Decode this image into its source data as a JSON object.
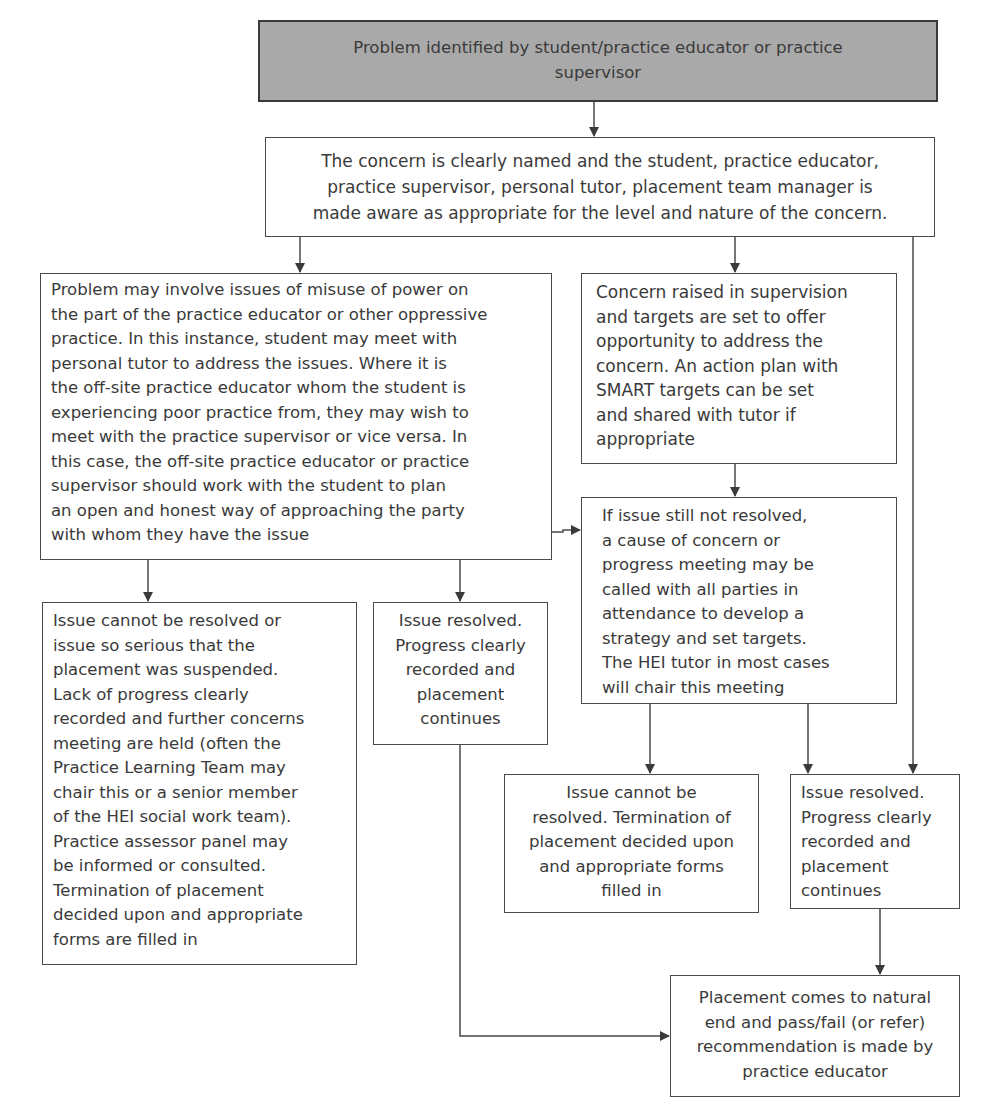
{
  "diagram": {
    "type": "flowchart",
    "nodes": {
      "start": {
        "text": "Problem identified by student/practice educator or practice supervisor",
        "lines": [
          "Problem identified by student/practice educator or practice",
          "supervisor"
        ],
        "fill": "#a9a9a9"
      },
      "concern_named": {
        "text": "The concern is clearly named and the student, practice educator, practice supervisor, personal tutor, placement team manager is made aware as appropriate for the level and nature of the concern.",
        "lines": [
          "The concern is clearly named and the student, practice educator,",
          "practice supervisor, personal tutor, placement team manager is",
          "made aware as appropriate for the level and nature of the concern."
        ]
      },
      "misuse_of_power": {
        "lines": [
          "Problem may involve issues of misuse of power on",
          "the part of the practice educator or other oppressive",
          "practice. In this instance, student may meet with",
          "personal tutor to address the issues. Where it is",
          "the off-site practice educator whom the student is",
          "experiencing poor practice from, they may wish to",
          "meet with the practice supervisor or vice versa. In",
          "this case, the off-site practice educator or practice",
          "supervisor should work with the student to plan",
          "an open and honest way of approaching the party",
          "with whom they have the issue"
        ]
      },
      "concern_in_supervision": {
        "lines": [
          "Concern raised in supervision",
          "and targets are set to offer",
          "opportunity to address the",
          "concern. An action plan with",
          "SMART targets can be set",
          "and shared with tutor if",
          "appropriate"
        ]
      },
      "progress_meeting": {
        "lines": [
          "If issue still not resolved,",
          "a cause of concern or",
          "progress meeting may be",
          "called with all parties in",
          "attendance to develop a",
          "strategy and set targets.",
          "The HEI tutor in most cases",
          "will chair this meeting"
        ]
      },
      "suspended": {
        "lines": [
          "Issue cannot be resolved or",
          "issue so serious that the",
          "placement was suspended.",
          "Lack of progress clearly",
          "recorded and further concerns",
          "meeting are held (often the",
          "Practice Learning Team may",
          "chair this or a senior member",
          "of the HEI social work team).",
          "Practice assessor panel may",
          "be informed or consulted.",
          "Termination of placement",
          "decided upon and appropriate",
          "forms are filled in"
        ]
      },
      "resolved_left": {
        "lines": [
          "Issue resolved.",
          "Progress clearly",
          "recorded and",
          "placement",
          "continues"
        ]
      },
      "termination": {
        "lines": [
          "Issue cannot be",
          "resolved. Termination of",
          "placement decided upon",
          "and appropriate forms",
          "filled in"
        ]
      },
      "resolved_right": {
        "lines": [
          "Issue resolved.",
          "Progress clearly",
          "recorded and",
          "placement",
          "continues"
        ]
      },
      "natural_end": {
        "lines": [
          "Placement comes to natural",
          "end and pass/fail (or refer)",
          "recommendation is made by",
          "practice educator"
        ]
      }
    },
    "edges": [
      [
        "start",
        "concern_named"
      ],
      [
        "concern_named",
        "misuse_of_power"
      ],
      [
        "concern_named",
        "concern_in_supervision"
      ],
      [
        "concern_named",
        "resolved_right"
      ],
      [
        "concern_in_supervision",
        "progress_meeting"
      ],
      [
        "misuse_of_power",
        "progress_meeting"
      ],
      [
        "misuse_of_power",
        "suspended"
      ],
      [
        "misuse_of_power",
        "resolved_left"
      ],
      [
        "progress_meeting",
        "termination"
      ],
      [
        "progress_meeting",
        "resolved_right"
      ],
      [
        "resolved_left",
        "natural_end"
      ],
      [
        "resolved_right",
        "natural_end"
      ]
    ],
    "colors": {
      "line": "#4a4a4a",
      "start_fill": "#a9a9a9",
      "text": "#3a3a3a"
    }
  }
}
